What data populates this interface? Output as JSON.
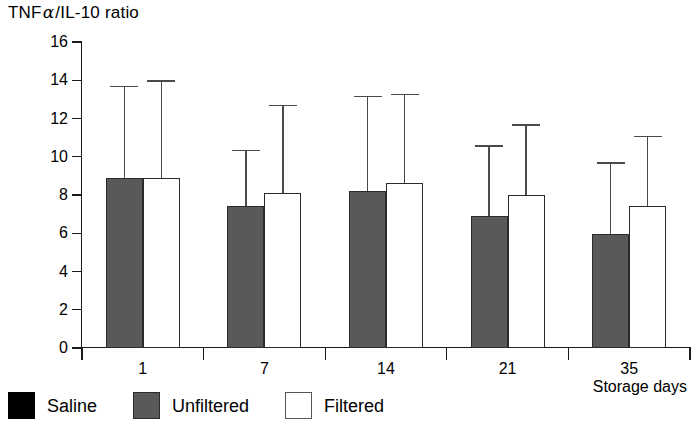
{
  "chart_data": {
    "type": "bar",
    "title_parts": {
      "pre": "TNF",
      "alpha": "α",
      "post": "/IL-10 ratio"
    },
    "xlabel": "Storage days",
    "ylabel": "",
    "categories": [
      "1",
      "7",
      "14",
      "21",
      "35"
    ],
    "ylim": [
      0,
      16
    ],
    "yticks": [
      0,
      2,
      4,
      6,
      8,
      10,
      12,
      14,
      16
    ],
    "ytick_labels": [
      "0",
      "2",
      "4",
      "6",
      "8",
      "10",
      "12",
      "14",
      "16"
    ],
    "grid": false,
    "legend_position": "below-axes",
    "error_bars": "upper-only",
    "series": [
      {
        "name": "Unfiltered",
        "color": "#595959",
        "values": [
          8.9,
          7.45,
          8.2,
          6.9,
          5.95
        ],
        "error_upper": [
          13.7,
          10.35,
          13.2,
          10.6,
          9.7
        ]
      },
      {
        "name": "Filtered",
        "color": "#ffffff",
        "values": [
          8.9,
          8.1,
          8.65,
          8.0,
          7.4
        ],
        "error_upper": [
          14.0,
          12.7,
          13.3,
          11.7,
          11.1
        ]
      }
    ],
    "legend": [
      {
        "label": "Saline",
        "color": "#000000",
        "style": "solid"
      },
      {
        "label": "Unfiltered",
        "color": "#595959",
        "style": "solid"
      },
      {
        "label": "Filtered",
        "color": "#ffffff",
        "style": "outline"
      }
    ]
  }
}
